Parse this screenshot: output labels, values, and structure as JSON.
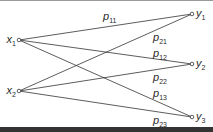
{
  "diagram": {
    "type": "bipartite-transition-graph",
    "colors": {
      "line": "#333333",
      "text": "#2a2a2a",
      "bottom_bar": "#333333",
      "top_line": "#9a9a9a"
    },
    "inputs": [
      {
        "id": "x1",
        "label": "x",
        "sub": "1",
        "x": 19,
        "y": 40
      },
      {
        "id": "x2",
        "label": "x",
        "sub": "2",
        "x": 19,
        "y": 91
      }
    ],
    "outputs": [
      {
        "id": "y1",
        "label": "y",
        "sub": "1",
        "x": 192,
        "y": 14
      },
      {
        "id": "y2",
        "label": "y",
        "sub": "2",
        "x": 192,
        "y": 64
      },
      {
        "id": "y3",
        "label": "y",
        "sub": "3",
        "x": 192,
        "y": 117
      }
    ],
    "edges": [
      {
        "from": "x1",
        "to": "y1",
        "label": "p",
        "sub": "11",
        "lx": 103,
        "ly": 20
      },
      {
        "from": "x2",
        "to": "y1",
        "label": "p",
        "sub": "21",
        "lx": 153,
        "ly": 41
      },
      {
        "from": "x1",
        "to": "y2",
        "label": "p",
        "sub": "12",
        "lx": 153,
        "ly": 57
      },
      {
        "from": "x2",
        "to": "y2",
        "label": "p",
        "sub": "22",
        "lx": 153,
        "ly": 81
      },
      {
        "from": "x1",
        "to": "y3",
        "label": "p",
        "sub": "13",
        "lx": 153,
        "ly": 97
      },
      {
        "from": "x2",
        "to": "y3",
        "label": "p",
        "sub": "23",
        "lx": 153,
        "ly": 124
      }
    ]
  }
}
